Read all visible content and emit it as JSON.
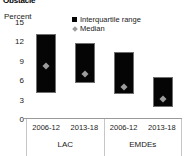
{
  "title": "Obstacle",
  "axis_unit": "Percent",
  "legend": [
    {
      "label": "Interquartile range",
      "marker": "box-marker",
      "color": "#050505"
    },
    {
      "label": "Median",
      "marker": "diamond-marker",
      "color": "#9c9c9c"
    }
  ],
  "yticks": [
    "15",
    "12",
    "9",
    "6",
    "3",
    "0"
  ],
  "groups": [
    {
      "label": "LAC",
      "periods": [
        "2006-12",
        "2013-18"
      ]
    },
    {
      "label": "EMDEs",
      "periods": [
        "2006-12",
        "2013-18"
      ]
    }
  ],
  "chart_data": {
    "type": "bar",
    "title": "Obstacle",
    "subtitle": "",
    "xlabel": "",
    "ylabel": "Percent",
    "ylim": [
      0,
      15
    ],
    "yticks": [
      0,
      3,
      6,
      9,
      12,
      15
    ],
    "grid": false,
    "legend_position": "top-right",
    "legend": [
      "Interquartile range",
      "Median"
    ],
    "categories": [
      "LAC 2006-12",
      "LAC 2013-18",
      "EMDEs 2006-12",
      "EMDEs 2013-18"
    ],
    "group_labels": [
      "LAC",
      "EMDEs"
    ],
    "period_labels": [
      "2006-12",
      "2013-18",
      "2006-12",
      "2013-18"
    ],
    "series": [
      {
        "name": "Interquartile range lower (q1)",
        "values": [
          4.0,
          5.5,
          3.9,
          1.8
        ]
      },
      {
        "name": "Interquartile range upper (q3)",
        "values": [
          13.2,
          11.7,
          10.3,
          6.5
        ]
      },
      {
        "name": "Median",
        "values": [
          8.2,
          6.9,
          5.0,
          3.1
        ]
      }
    ],
    "boxes": [
      {
        "category": "LAC 2006-12",
        "q1": 4.0,
        "q3": 13.2,
        "median": 8.2
      },
      {
        "category": "LAC 2013-18",
        "q1": 5.5,
        "q3": 11.7,
        "median": 6.9
      },
      {
        "category": "EMDEs 2006-12",
        "q1": 3.9,
        "q3": 10.3,
        "median": 5.0
      },
      {
        "category": "EMDEs 2013-18",
        "q1": 1.8,
        "q3": 6.5,
        "median": 3.1
      }
    ],
    "colors": {
      "box": "#050505",
      "box_edge": "#6f6f6f",
      "median": "#9c9c9c",
      "axis": "#9a9a9a"
    }
  }
}
